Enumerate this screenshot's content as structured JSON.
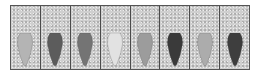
{
  "figure": {
    "tiles": [
      {
        "index": 1,
        "shape_fill": "#b4b4b4"
      },
      {
        "index": 2,
        "shape_fill": "#5c5c5c"
      },
      {
        "index": 3,
        "shape_fill": "#747474"
      },
      {
        "index": 4,
        "shape_fill": "#e2e2e2"
      },
      {
        "index": 5,
        "shape_fill": "#9c9c9c"
      },
      {
        "index": 6,
        "shape_fill": "#3a3a3a"
      },
      {
        "index": 7,
        "shape_fill": "#acacac"
      },
      {
        "index": 8,
        "shape_fill": "#3e3e3e"
      }
    ],
    "colors": {
      "background": "#cfcfcf",
      "divider": "#4a4a4a",
      "border": "#555555"
    }
  }
}
